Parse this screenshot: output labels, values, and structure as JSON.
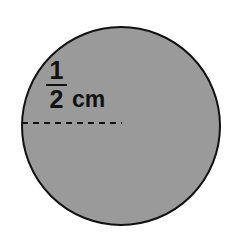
{
  "figure": {
    "shape": "circle",
    "fill_color": "#9a9a9a",
    "outline_color": "#111111",
    "background_color": "#ffffff",
    "circle": {
      "center_x": 121,
      "center_y": 126,
      "radius": 99,
      "stroke_width": 2
    },
    "radius_line": {
      "style": "dashed",
      "color": "#111111",
      "x_start": 22,
      "x_end": 122,
      "y": 123,
      "dash": "6 5",
      "stroke_width": 2
    },
    "measurement": {
      "numerator": "1",
      "denominator": "2",
      "unit": "cm",
      "full_text": "1/2 cm"
    }
  }
}
